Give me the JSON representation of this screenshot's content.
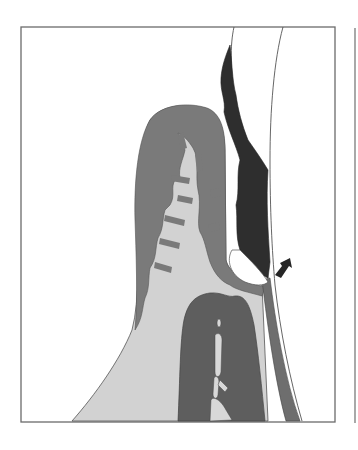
{
  "figure": {
    "type": "anatomical-cross-section",
    "panels": 2,
    "visible_panel": "left",
    "arrow_direction": "up-right"
  },
  "colors": {
    "background": "#ffffff",
    "frame": "#6b6b6b",
    "outline": "#555555",
    "gingiva_epithelium": "#7a7a7a",
    "connective_tissue": "#d2d2d2",
    "bone_dark": "#5e5e5e",
    "bone_marrow": "#d8d8d8",
    "calculus_plaque": "#2e2e2e",
    "tooth_surface": "#ffffff",
    "root_band": "#6e6e6e",
    "arrow": "#262626"
  },
  "labels": {
    "text": ""
  }
}
